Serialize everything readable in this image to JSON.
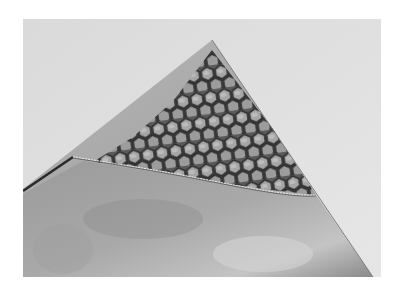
{
  "image": {
    "kind": "grayscale photograph",
    "subject": "honeycomb sandwich panel with peeled face sheet",
    "description": "Triangular corner of a panel; the top face sheet is peeled back, exposing a hexagonal honeycomb core.",
    "colors": {
      "page_background": "#ffffff",
      "sky_background": "#d9d9d9",
      "face_sheet_light": "#b8b8b8",
      "face_sheet_dark": "#8e8e8e",
      "cell_wall": "#3a3a3a",
      "cell_fill": "#a8a8a8"
    }
  }
}
